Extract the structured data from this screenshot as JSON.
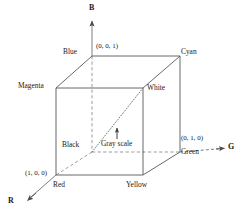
{
  "figure": {
    "name": "RGB color cube diagram",
    "stroke_color": "#555555",
    "text_color": "#1a1a1a",
    "background": "#ffffff"
  },
  "axes": [
    {
      "id": "b",
      "label": "B",
      "direction": "up"
    },
    {
      "id": "g",
      "label": "G",
      "direction": "right"
    },
    {
      "id": "r",
      "label": "R",
      "direction": "down-left"
    }
  ],
  "vertices": [
    {
      "id": "blue",
      "label": "Blue",
      "coord": "(0, 0, 1)"
    },
    {
      "id": "cyan",
      "label": "Cyan",
      "coord": ""
    },
    {
      "id": "magenta",
      "label": "Magenta",
      "coord": ""
    },
    {
      "id": "white",
      "label": "White",
      "coord": ""
    },
    {
      "id": "black",
      "label": "Black",
      "coord": ""
    },
    {
      "id": "green",
      "label": "Green",
      "coord": "(0, 1, 0)"
    },
    {
      "id": "red",
      "label": "Red",
      "coord": "(1, 0, 0)"
    },
    {
      "id": "yellow",
      "label": "Yellow",
      "coord": ""
    }
  ],
  "annotations": {
    "gray_scale": "Gray scale"
  }
}
